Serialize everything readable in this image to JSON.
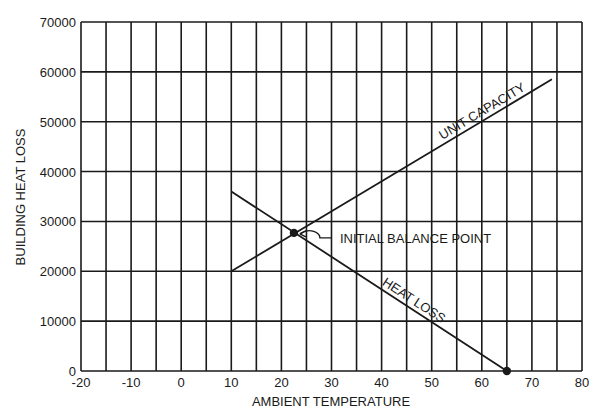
{
  "chart_data": {
    "type": "line",
    "title": "",
    "xlabel": "AMBIENT TEMPERATURE",
    "ylabel": "BUILDING HEAT LOSS",
    "xlim": [
      -20,
      80
    ],
    "ylim": [
      0,
      70000
    ],
    "x_ticks": [
      -20,
      -10,
      0,
      10,
      20,
      30,
      40,
      50,
      60,
      70,
      80
    ],
    "y_ticks": [
      0,
      10000,
      20000,
      30000,
      40000,
      50000,
      60000,
      70000
    ],
    "x_tick_labels": [
      "-20",
      "-10",
      "0",
      "10",
      "20",
      "30",
      "40",
      "50",
      "60",
      "70",
      "80"
    ],
    "y_tick_labels": [
      "0",
      "10000",
      "20000",
      "30000",
      "40000",
      "50000",
      "60000",
      "70000"
    ],
    "grid": {
      "vertical_every": 5,
      "horizontal_every": 10000
    },
    "legend": null,
    "series": [
      {
        "name": "UNIT CAPACITY",
        "x": [
          10,
          74
        ],
        "y": [
          20000,
          58500
        ]
      },
      {
        "name": "HEAT LOSS",
        "x": [
          10,
          65
        ],
        "y": [
          36000,
          0
        ]
      }
    ],
    "points": [
      {
        "label": "INITIAL BALANCE POINT",
        "x": 22.5,
        "y": 27700
      },
      {
        "label": "",
        "x": 65,
        "y": 0
      }
    ],
    "annotations": [
      {
        "text": "UNIT CAPACITY",
        "anchor": "along unit capacity line near upper end"
      },
      {
        "text": "HEAT LOSS",
        "anchor": "along heat loss line near x=45"
      },
      {
        "text": "INITIAL BALANCE POINT",
        "anchor": "callout to intersection"
      }
    ]
  }
}
